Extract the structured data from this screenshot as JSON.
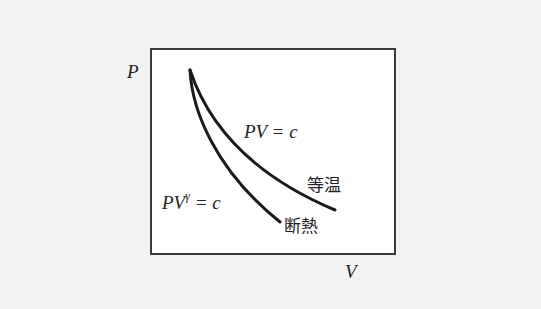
{
  "diagram": {
    "title": "",
    "axes": {
      "y_label": "P",
      "x_label": "V"
    },
    "curves": [
      {
        "name": "isothermal",
        "equation": "PV = c",
        "label_jp": "等温",
        "color": "#1a1a1a"
      },
      {
        "name": "adiabatic",
        "equation_base": "PV",
        "equation_exp": "γ",
        "equation_rest": " = c",
        "label_jp": "断熱",
        "color": "#1a1a1a"
      }
    ],
    "colors": {
      "background": "#f2f2f2",
      "frame_fill": "#ffffff",
      "frame_stroke": "#3a3a3a",
      "ink": "#1a1a1a"
    }
  }
}
